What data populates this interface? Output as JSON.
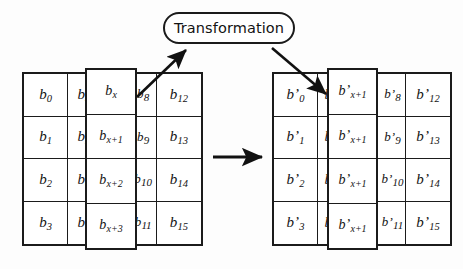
{
  "diagram": {
    "title_pill": {
      "label": "Transformation",
      "shape": "rounded-rectangle"
    },
    "colors": {
      "stroke": "#1b1b1b",
      "fill": "#ffffff",
      "background": "#fdfdfd",
      "text": "#121212"
    },
    "left_matrix": {
      "name": "state-matrix-before",
      "rows": 4,
      "columns": 4,
      "cells": [
        [
          {
            "base": "b",
            "sub": "0"
          },
          {
            "base": "b",
            "sub": "4"
          },
          {
            "base": "b",
            "sub": "8"
          },
          {
            "base": "b",
            "sub": "12"
          }
        ],
        [
          {
            "base": "b",
            "sub": "1"
          },
          {
            "base": "b",
            "sub": "5"
          },
          {
            "base": "b",
            "sub": "9"
          },
          {
            "base": "b",
            "sub": "13"
          }
        ],
        [
          {
            "base": "b",
            "sub": "2"
          },
          {
            "base": "b",
            "sub": "6"
          },
          {
            "base": "b",
            "sub": "10"
          },
          {
            "base": "b",
            "sub": "14"
          }
        ],
        [
          {
            "base": "b",
            "sub": "3"
          },
          {
            "base": "b",
            "sub": "7"
          },
          {
            "base": "b",
            "sub": "11"
          },
          {
            "base": "b",
            "sub": "15"
          }
        ]
      ],
      "overlay_column": {
        "name": "selected-column-before",
        "cells": [
          {
            "base": "b",
            "sub": "x"
          },
          {
            "base": "b",
            "sub": "x+1"
          },
          {
            "base": "b",
            "sub": "x+2"
          },
          {
            "base": "b",
            "sub": "x+3"
          }
        ]
      }
    },
    "right_matrix": {
      "name": "state-matrix-after",
      "rows": 4,
      "columns": 4,
      "cells": [
        [
          {
            "base": "b’",
            "sub": "0"
          },
          {
            "base": "b’",
            "sub": "4"
          },
          {
            "base": "b’",
            "sub": "8"
          },
          {
            "base": "b’",
            "sub": "12"
          }
        ],
        [
          {
            "base": "b’",
            "sub": "1"
          },
          {
            "base": "b’",
            "sub": "5"
          },
          {
            "base": "b’",
            "sub": "9"
          },
          {
            "base": "b’",
            "sub": "13"
          }
        ],
        [
          {
            "base": "b’",
            "sub": "2"
          },
          {
            "base": "b’",
            "sub": "6"
          },
          {
            "base": "b’",
            "sub": "10"
          },
          {
            "base": "b’",
            "sub": "14"
          }
        ],
        [
          {
            "base": "b’",
            "sub": "3"
          },
          {
            "base": "b’",
            "sub": "7"
          },
          {
            "base": "b’",
            "sub": "11"
          },
          {
            "base": "b’",
            "sub": "15"
          }
        ]
      ],
      "overlay_column": {
        "name": "selected-column-after",
        "cells": [
          {
            "base": "b’",
            "sub": "x+1"
          },
          {
            "base": "b’",
            "sub": "x+1"
          },
          {
            "base": "b’",
            "sub": "x+1"
          },
          {
            "base": "b’",
            "sub": "x+1"
          }
        ]
      }
    },
    "arrows": [
      {
        "name": "arrow-column-to-transformation",
        "from": "left-overlay-column",
        "to": "transformation-pill"
      },
      {
        "name": "arrow-transformation-to-column",
        "from": "transformation-pill",
        "to": "right-overlay-column"
      },
      {
        "name": "arrow-matrix-to-matrix",
        "from": "left-matrix",
        "to": "right-matrix"
      }
    ]
  }
}
